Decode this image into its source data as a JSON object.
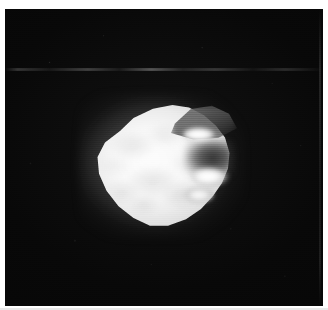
{
  "plate": {
    "width_px": 328,
    "height_px": 310,
    "margin_color": "#ffffff",
    "caption": ""
  },
  "frame": {
    "name": "astronomical-image-frame",
    "background_color": "#050505",
    "left_px": 5,
    "top_px": 9,
    "width_px": 318,
    "height_px": 297
  },
  "subject": {
    "description": "Irregular sunlit small body against black sky",
    "shape": "rounded irregular ellipsoid, flattened and notched on the right limb",
    "tone": "near-white saturated disc with grey terminator shoulder at upper right",
    "center_x_px": 157,
    "center_y_px": 157,
    "width_px": 150,
    "height_px": 130,
    "body_color": "#fdfdfd",
    "shadow_color": "#707070",
    "sky_color": "#050505"
  },
  "features": [
    {
      "name": "shadowed-shoulder",
      "label": "Grey terminator shoulder, upper right",
      "gray_level": "#707070"
    },
    {
      "name": "limb-notch",
      "label": "Dark notch cutting into the right limb",
      "gray_level": "#1c1c1c"
    },
    {
      "name": "bright-knob-upper",
      "label": "Bright highlight knob, upper right limb",
      "gray_level": "#ffffff"
    },
    {
      "name": "bright-knob-wedge",
      "label": "Bright protruding wedge, mid right limb",
      "gray_level": "#ffffff"
    },
    {
      "name": "bright-knob-lower",
      "label": "Bright patch, lower right limb",
      "gray_level": "#fbfbfb"
    }
  ],
  "artifacts": {
    "scan_lines": "horizontal video raster striping across full frame",
    "dropout_line": "faint horizontal dropout streak near top of frame",
    "right_edge_streak": "faint bright column along right edge",
    "grain": "sparse film grain specks across the dark sky"
  }
}
